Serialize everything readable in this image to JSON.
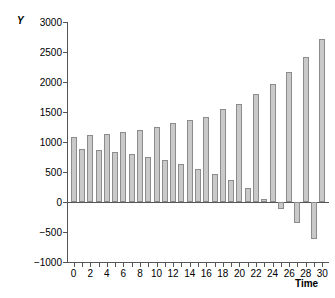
{
  "chart_data": {
    "type": "bar",
    "title": "",
    "xlabel": "Time",
    "ylabel": "Y",
    "xlim": [
      -0.8,
      30.8
    ],
    "ylim": [
      -1000,
      3000
    ],
    "grid": false,
    "legend": null,
    "bar_color": "#c9c9c9",
    "bar_edge_color": "#8c8c8c",
    "axis_color": "#555555",
    "yticks": [
      3000,
      2500,
      2000,
      1500,
      1000,
      500,
      0,
      -500,
      -1000
    ],
    "ytick_labels": [
      "3000",
      "2500",
      "2000",
      "1500",
      "1000",
      "500",
      "0",
      "-500",
      "-1000"
    ],
    "xticks": [
      0,
      1,
      2,
      3,
      4,
      5,
      6,
      7,
      8,
      9,
      10,
      11,
      12,
      13,
      14,
      15,
      16,
      17,
      18,
      19,
      20,
      21,
      22,
      23,
      24,
      25,
      26,
      27,
      28,
      29,
      30
    ],
    "xtick_labels": [
      {
        "x": 0,
        "label": "0"
      },
      {
        "x": 2,
        "label": "2"
      },
      {
        "x": 4,
        "label": "4"
      },
      {
        "x": 6,
        "label": "6"
      },
      {
        "x": 8,
        "label": "8"
      },
      {
        "x": 10,
        "label": "10"
      },
      {
        "x": 12,
        "label": "12"
      },
      {
        "x": 14,
        "label": "14"
      },
      {
        "x": 16,
        "label": "16"
      },
      {
        "x": 18,
        "label": "18"
      },
      {
        "x": 20,
        "label": "20"
      },
      {
        "x": 22,
        "label": "22"
      },
      {
        "x": 24,
        "label": "24"
      },
      {
        "x": 26,
        "label": "26"
      },
      {
        "x": 28,
        "label": "28"
      },
      {
        "x": 30,
        "label": "30"
      }
    ],
    "categories": [
      0,
      1,
      2,
      3,
      4,
      5,
      6,
      7,
      8,
      9,
      10,
      11,
      12,
      13,
      14,
      15,
      16,
      17,
      18,
      19,
      20,
      21,
      22,
      23,
      24,
      25,
      26,
      27,
      28,
      29,
      30
    ],
    "values": [
      1090,
      890,
      1115,
      870,
      1135,
      830,
      1175,
      795,
      1200,
      745,
      1255,
      705,
      1315,
      640,
      1365,
      555,
      1425,
      475,
      1550,
      370,
      1640,
      230,
      1795,
      50,
      1975,
      -120,
      2175,
      -345,
      2420,
      -610,
      2720
    ]
  }
}
